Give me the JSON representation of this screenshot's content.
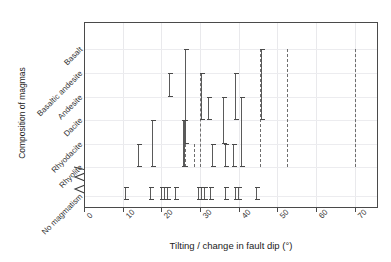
{
  "chart_data": {
    "type": "range-bar",
    "title": "",
    "xlabel": "Tilting / change in fault dip (°)",
    "ylabel": "Composition of magmas",
    "xlim": [
      0,
      76
    ],
    "xticks": [
      0,
      10,
      20,
      30,
      40,
      50,
      60,
      70
    ],
    "xticklabels": [
      "0",
      "10",
      "20",
      "30",
      "40",
      "50",
      "60",
      "70"
    ],
    "categories": [
      "Basalt",
      "Basaltic andesite",
      "Andesite",
      "Dacite",
      "Rhyodacite",
      "Rhyolite",
      "No magmatism"
    ],
    "grid": true,
    "legend": null,
    "axis_break_between": [
      "Rhyolite",
      "No magmatism"
    ],
    "series": [
      {
        "name": "magma composition ranges",
        "note": "Each item is a vertical bar at an x tilting value spanning a range of magma compositions (category indices 0=Basalt .. 5=Rhyolite, 6=No magmatism).",
        "items": [
          {
            "x": 22.0,
            "from": "Basaltic andesite",
            "to": "Andesite",
            "style": "solid"
          },
          {
            "x": 26.0,
            "from": "Basalt",
            "to": "Rhyolite",
            "style": "dashed"
          },
          {
            "x": 26.2,
            "from": "Basalt",
            "to": "Rhyodacite",
            "style": "solid"
          },
          {
            "x": 30.0,
            "from": "Basaltic andesite",
            "to": "Rhyolite",
            "style": "dashed"
          },
          {
            "x": 30.2,
            "from": "Basaltic andesite",
            "to": "Dacite",
            "style": "solid"
          },
          {
            "x": 32.0,
            "from": "Andesite",
            "to": "Dacite",
            "style": "solid"
          },
          {
            "x": 36.0,
            "from": "Andesite",
            "to": "Rhyodacite",
            "style": "solid"
          },
          {
            "x": 39.0,
            "from": "Basaltic andesite",
            "to": "Dacite",
            "style": "solid"
          },
          {
            "x": 40.5,
            "from": "Andesite",
            "to": "Rhyolite",
            "style": "solid"
          },
          {
            "x": 45.5,
            "from": "Basalt",
            "to": "Rhyolite",
            "style": "dashed"
          },
          {
            "x": 45.8,
            "from": "Basalt",
            "to": "Dacite",
            "style": "solid"
          },
          {
            "x": 52.5,
            "from": "Basalt",
            "to": "Rhyolite",
            "style": "dashed"
          },
          {
            "x": 70.0,
            "from": "Basalt",
            "to": "Rhyolite",
            "style": "dashed"
          },
          {
            "x": 14.0,
            "from": "Rhyodacite",
            "to": "Rhyolite",
            "style": "solid"
          },
          {
            "x": 17.5,
            "from": "Dacite",
            "to": "Rhyolite",
            "style": "solid"
          },
          {
            "x": 25.5,
            "from": "Dacite",
            "to": "Rhyolite",
            "style": "solid"
          },
          {
            "x": 25.9,
            "from": "Dacite",
            "to": "Rhyolite",
            "style": "solid"
          },
          {
            "x": 28.5,
            "from": "Rhyodacite",
            "to": "Rhyolite",
            "style": "dashed"
          },
          {
            "x": 33.0,
            "from": "Rhyodacite",
            "to": "Rhyolite",
            "style": "solid"
          },
          {
            "x": 36.5,
            "from": "Rhyodacite",
            "to": "Rhyolite",
            "style": "solid"
          },
          {
            "x": 38.5,
            "from": "Rhyodacite",
            "to": "Rhyolite",
            "style": "solid"
          }
        ],
        "no_magmatism_marks": [
          10.5,
          17.0,
          20.0,
          20.7,
          21.4,
          23.5,
          29.5,
          30.2,
          30.9,
          32.5,
          36.5,
          39.0,
          39.8,
          44.5
        ]
      }
    ]
  },
  "axis": {
    "x_title": "Tilting / change in fault dip (°)",
    "y_title": "Composition of magmas",
    "break_symbol": "zigzag-axis-break"
  }
}
